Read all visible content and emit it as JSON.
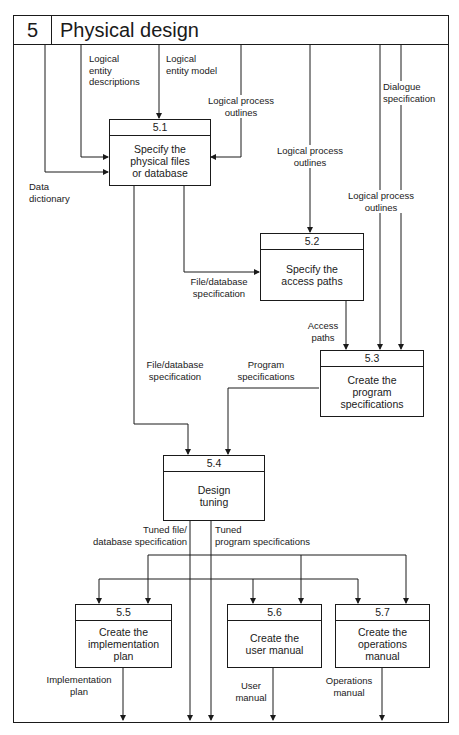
{
  "header": {
    "number": "5",
    "title": "Physical design"
  },
  "processes": [
    {
      "id": "5.1",
      "label": "Specify the\nphysical files\nor database"
    },
    {
      "id": "5.2",
      "label": "Specify the\naccess paths"
    },
    {
      "id": "5.3",
      "label": "Create the\nprogram\nspecifications"
    },
    {
      "id": "5.4",
      "label": "Design\ntuning"
    },
    {
      "id": "5.5",
      "label": "Create the\nimplementation\nplan"
    },
    {
      "id": "5.6",
      "label": "Create the\nuser manual"
    },
    {
      "id": "5.7",
      "label": "Create the\noperations\nmanual"
    }
  ],
  "flows": {
    "logical_entity_descriptions": "Logical\nentity\ndescriptions",
    "logical_entity_model": "Logical\nentity model",
    "logical_process_outlines_1": "Logical process\noutlines",
    "data_dictionary": "Data\ndictionary",
    "logical_process_outlines_2": "Logical process\noutlines",
    "dialogue_specification": "Dialogue\nspecification",
    "logical_process_outlines_3": "Logical process\noutlines",
    "file_database_specification_1": "File/database\nspecification",
    "access_paths": "Access\npaths",
    "file_database_specification_2": "File/database\nspecification",
    "program_specifications": "Program\nspecifications",
    "tuned_file_database_specification": "Tuned file/\ndatabase specification",
    "tuned_program_specifications": "Tuned\nprogram specifications",
    "implementation_plan": "Implementation\nplan",
    "user_manual": "User\nmanual",
    "operations_manual": "Operations\nmanual"
  }
}
